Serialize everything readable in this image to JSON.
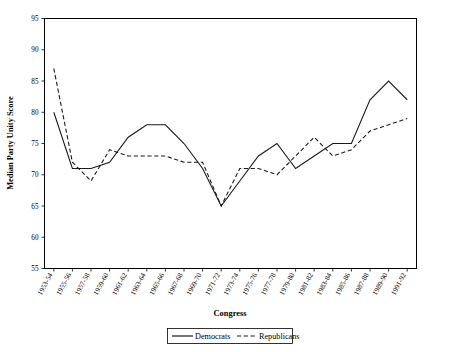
{
  "chart_data": {
    "type": "line",
    "title": "",
    "xlabel": "Congress",
    "ylabel": "Median Party Unity Score",
    "ylim": [
      55,
      95
    ],
    "ytick_step": 5,
    "yticks": [
      55,
      60,
      65,
      70,
      75,
      80,
      85,
      90,
      95
    ],
    "grid": false,
    "legend_position": "bottom-center",
    "categories": [
      "1953-54",
      "1955-56",
      "1957-58",
      "1959-60",
      "1961-62",
      "1963-64",
      "1965-66",
      "1967-68",
      "1969-70",
      "1971-72",
      "1973-74",
      "1975-76",
      "1977-78",
      "1979-80",
      "1981-82",
      "1983-84",
      "1985-86",
      "1987-88",
      "1989-90",
      "1991-92"
    ],
    "series": [
      {
        "name": "Democrats",
        "style": "solid",
        "color": "#1a1a1a",
        "values": [
          80,
          71,
          71,
          72,
          76,
          78,
          78,
          75,
          71,
          65,
          69,
          73,
          75,
          71,
          73,
          75,
          75,
          82,
          85,
          82
        ]
      },
      {
        "name": "Republicans",
        "style": "dashed",
        "color": "#1a1a1a",
        "values": [
          87,
          72,
          69,
          74,
          73,
          73,
          73,
          72,
          72,
          65,
          71,
          71,
          70,
          73,
          76,
          73,
          74,
          77,
          78,
          79
        ]
      }
    ],
    "legend": [
      "Democrats",
      "Republicans"
    ]
  },
  "legend": {
    "democrats_label": "Democrats",
    "republicans_label": "Republicans"
  },
  "axes": {
    "x_title": "Congress",
    "y_title": "Median Party Unity Score"
  }
}
